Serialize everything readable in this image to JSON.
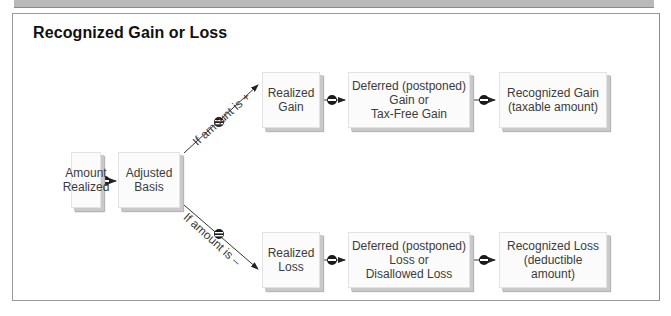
{
  "diagram": {
    "title": "Recognized Gain or Loss",
    "nodes": {
      "amount_realized": "Amount\nRealized",
      "adjusted_basis": "Adjusted\nBasis",
      "realized_gain": "Realized\nGain",
      "deferred_gain": "Deferred (postponed)\nGain or\nTax-Free Gain",
      "recognized_gain": "Recognized Gain\n(taxable amount)",
      "realized_loss": "Realized\nLoss",
      "deferred_loss": "Deferred (postponed)\nLoss or\nDisallowed Loss",
      "recognized_loss": "Recognized Loss\n(deductible\namount)"
    },
    "branch_labels": {
      "positive": "If amount is +",
      "negative": "If amount is –"
    },
    "operator_icon": "minus-circle-icon",
    "colors": {
      "box_fill": "#fbfbfb",
      "box_shadow": "#c9c9c9",
      "text": "#3b3b3b",
      "operator": "#1a1a1a",
      "line": "#333333"
    }
  }
}
